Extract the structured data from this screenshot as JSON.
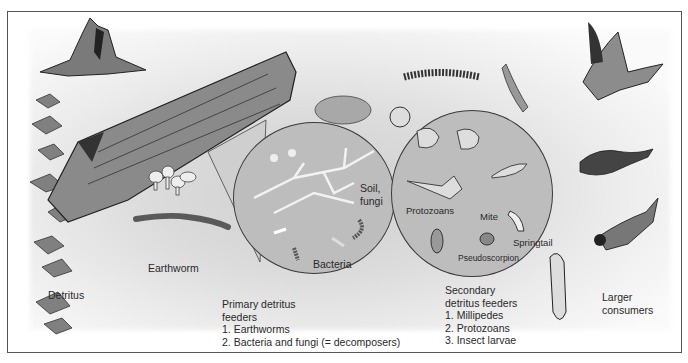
{
  "diagram": {
    "labels": {
      "detritus": "Detritus",
      "earthworm": "Earthworm",
      "soil_fungi": [
        "Soil,",
        "fungi"
      ],
      "bacteria": "Bacteria",
      "protozoans": "Protozoans",
      "mite": "Mite",
      "springtail": "Springtail",
      "pseudoscorpion": "Pseudoscorpion",
      "larger_consumers": [
        "Larger",
        "consumers"
      ]
    },
    "primary": {
      "heading": [
        "Primary detritus",
        "feeders"
      ],
      "items": [
        "1. Earthworms",
        "2. Bacteria and fungi (= decomposers)"
      ]
    },
    "secondary": {
      "heading": [
        "Secondary",
        "detritus feeders"
      ],
      "items": [
        "1. Millipedes",
        "2. Protozoans",
        "3. Insect larvae"
      ]
    },
    "illustrations": [
      "tree-stump",
      "rotting-log",
      "mushrooms",
      "leaf-litter",
      "earthworm",
      "millipede",
      "slug",
      "snail",
      "fungal-hyphae",
      "bacteria",
      "amoeba",
      "paramecium",
      "flagellate",
      "mite",
      "springtail",
      "pseudoscorpion",
      "insect-larva",
      "hawk",
      "shrew",
      "bird"
    ]
  }
}
